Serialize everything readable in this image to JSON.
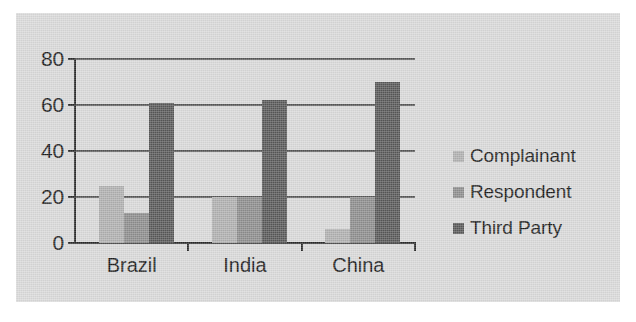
{
  "chart_data": {
    "type": "bar",
    "title": "",
    "subtitle": "",
    "xlabel": "",
    "ylabel": "",
    "categories": [
      "Brazil",
      "India",
      "China"
    ],
    "series": [
      {
        "name": "Complainant",
        "values": [
          25,
          20,
          6
        ],
        "color": "#b0b0b0"
      },
      {
        "name": "Respondent",
        "values": [
          13,
          20,
          20
        ],
        "color": "#8d8d8d"
      },
      {
        "name": "Third Party",
        "values": [
          61,
          62,
          70
        ],
        "color": "#585858"
      }
    ],
    "ylim": [
      0,
      80
    ],
    "ytick_values": [
      0,
      20,
      40,
      60,
      80
    ],
    "ytick_labels": [
      "0",
      "20",
      "40",
      "60",
      "80"
    ],
    "grid": true,
    "grid_axis": "y",
    "legend_position": "right",
    "bar_group_mode": "grouped"
  },
  "legend": {
    "items": [
      {
        "label": "Complainant",
        "color": "#b0b0b0",
        "swatch_icon": "square-swatch-icon"
      },
      {
        "label": "Respondent",
        "color": "#8d8d8d",
        "swatch_icon": "square-swatch-icon"
      },
      {
        "label": "Third Party",
        "color": "#585858",
        "swatch_icon": "square-swatch-icon"
      }
    ]
  },
  "style": {
    "panel_background": "#d9d9d9",
    "page_background": "#ffffff",
    "axis_color": "#2b2b2b",
    "gridline_color": "#3a3a3a",
    "text_color": "#1c1c1c"
  }
}
